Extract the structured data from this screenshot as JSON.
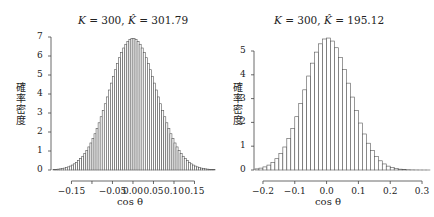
{
  "chart_data": [
    {
      "type": "bar",
      "title": "K = 300, K̂ = 301.79",
      "title_parts": {
        "k": "K",
        "k_val": "= 300,",
        "khat": "K̂",
        "khat_val": "= 301.79"
      },
      "xlabel": "cos θ",
      "ylabel": "確率密度",
      "xlim": [
        -0.195,
        0.2
      ],
      "ylim": [
        0,
        7
      ],
      "xticks": [
        -0.15,
        -0.1,
        -0.05,
        0.0,
        0.05,
        0.1,
        0.15
      ],
      "xtick_labels": [
        "−0.15",
        "",
        "−0.05",
        "0.00",
        "0.05",
        "0.10",
        "0.15"
      ],
      "yticks": [
        0,
        1,
        2,
        3,
        4,
        5,
        6,
        7
      ],
      "ytick_labels": [
        "0",
        "1",
        "2",
        "3",
        "4",
        "5",
        "6",
        "7"
      ],
      "bin_width": 0.005,
      "bin_start": -0.195,
      "sigma": 0.0576,
      "mean": 0.0,
      "peak": 6.93,
      "grid": false
    },
    {
      "type": "bar",
      "title": "K = 300, K̂ = 195.12",
      "title_parts": {
        "k": "K",
        "k_val": "= 300,",
        "khat": "K̂",
        "khat_val": "= 195.12"
      },
      "xlabel": "cos θ",
      "ylabel": "確率密度",
      "xlim": [
        -0.225,
        0.325
      ],
      "ylim": [
        0,
        5
      ],
      "xticks": [
        -0.2,
        -0.1,
        0.0,
        0.1,
        0.2,
        0.3
      ],
      "xtick_labels": [
        "−0.2",
        "−0.1",
        "0.0",
        "0.1",
        "0.2",
        "0.3"
      ],
      "yticks": [
        0,
        1,
        2,
        3,
        4,
        5
      ],
      "ytick_labels": [
        "0",
        "1",
        "2",
        "3",
        "4",
        "5"
      ],
      "bin_width": 0.0125,
      "bin_start": -0.225,
      "sigma": 0.0718,
      "mean": 0.003,
      "peak": 5.55,
      "grid": false
    }
  ]
}
